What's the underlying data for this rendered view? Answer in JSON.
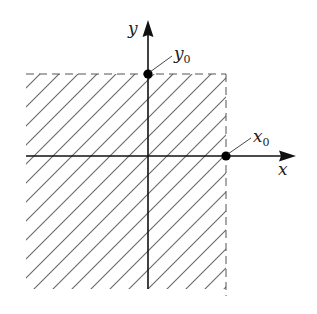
{
  "figure": {
    "caption_cut_off": true,
    "axes": {
      "x_label": "x",
      "y_label": "y",
      "origin_px": [
        148,
        156
      ],
      "x_axis_px": {
        "start": 26,
        "arrow_tip": 296
      },
      "y_axis_px": {
        "arrow_tip": 20,
        "end": 289
      }
    },
    "points": [
      {
        "id": "x0",
        "label": "x",
        "subscript": "0",
        "px": [
          226,
          156
        ],
        "description": "point on x-axis"
      },
      {
        "id": "y0",
        "label": "y",
        "subscript": "0",
        "px": [
          148,
          74
        ],
        "description": "point on y-axis"
      }
    ],
    "region": {
      "description": "hatched region x <= x0, y <= y0",
      "bounds_px": {
        "left": 26,
        "top": 74,
        "right": 226,
        "bottom": 289
      },
      "boundary_style": "dashed",
      "hatch_style": "diagonal (45 degrees, /)",
      "hatch_spacing_px": 19
    },
    "colors": {
      "axis": "#111111",
      "hatch": "#666666",
      "dashed_boundary": "#555555",
      "point": "#000000",
      "label": "#222222"
    }
  }
}
